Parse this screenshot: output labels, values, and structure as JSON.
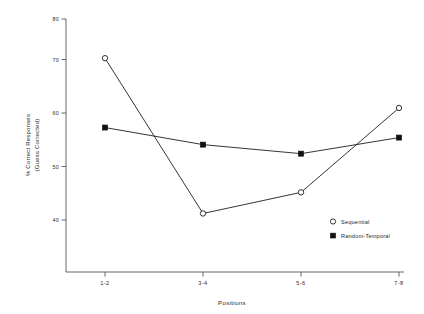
{
  "chart_data": {
    "type": "line",
    "title": "",
    "xlabel": "Positions",
    "ylabel": "% Correct Responses (Guess Corrected)",
    "ylabel_line1": "% Correct Responses",
    "ylabel_line2": "(Guess Corrected)",
    "categories": [
      "1-2",
      "3-4",
      "5-6",
      "7-8"
    ],
    "ylim": [
      38,
      80
    ],
    "yticks": [
      40,
      50,
      60,
      70,
      80
    ],
    "ytick_labels": [
      "40",
      "50",
      "60",
      "70",
      "80"
    ],
    "grid": false,
    "legend_position": "lower-right",
    "series": [
      {
        "name": "Sequential",
        "marker": "open-circle",
        "values": [
          72.2,
          41.3,
          45.5,
          62.3
        ]
      },
      {
        "name": "Random-Temporal",
        "marker": "filled-square",
        "values": [
          58.4,
          55.0,
          53.2,
          56.4
        ]
      }
    ],
    "colors": {
      "line": "#111111",
      "axis": "#555555",
      "text": "#1f1f1f",
      "background": "#ffffff"
    }
  },
  "legend": {
    "items": [
      {
        "label": "Sequential",
        "marker": "open-circle"
      },
      {
        "label": "Random-Temporal",
        "marker": "filled-square"
      }
    ]
  },
  "axes": {
    "x_title": "Positions",
    "y_title_line1": "% Correct Responses",
    "y_title_line2": "(Guess Corrected)",
    "x_tick_labels": [
      "1-2",
      "3-4",
      "5-6",
      "7-8"
    ],
    "y_tick_labels": [
      "80",
      "70",
      "60",
      "50",
      "40"
    ]
  }
}
